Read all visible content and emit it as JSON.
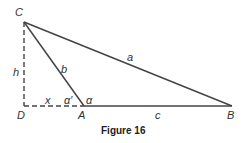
{
  "figure": {
    "caption": "Figure 16",
    "vertices": {
      "C": {
        "label": "C"
      },
      "D": {
        "label": "D"
      },
      "A": {
        "label": "A"
      },
      "B": {
        "label": "B"
      }
    },
    "sides": {
      "a": "a",
      "b": "b",
      "c": "c",
      "h": "h",
      "x": "x"
    },
    "angles": {
      "alpha": "α",
      "alpha_prime": "α′"
    },
    "colors": {
      "line": "#444444",
      "text": "#333333"
    }
  }
}
